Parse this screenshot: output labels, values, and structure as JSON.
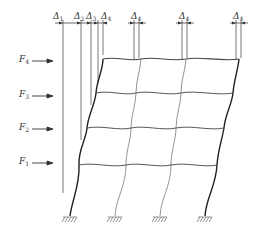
{
  "diagram": {
    "forces": [
      {
        "symbol": "F",
        "sub": "4",
        "y": 61
      },
      {
        "symbol": "F",
        "sub": "3",
        "y": 96
      },
      {
        "symbol": "F",
        "sub": "2",
        "y": 129
      },
      {
        "symbol": "F",
        "sub": "1",
        "y": 163
      }
    ],
    "displacements_left": [
      {
        "symbol": "Δ",
        "sub": "1",
        "x": 62,
        "line_bottom": 193
      },
      {
        "symbol": "Δ",
        "sub": "2",
        "x": 80,
        "line_bottom": 140
      },
      {
        "symbol": "Δ",
        "sub": "3",
        "x": 90,
        "line_bottom": 105
      },
      {
        "symbol": "Δ",
        "sub": "4",
        "x": 100,
        "line_bottom": 55
      }
    ],
    "displacements_right": [
      {
        "symbol": "Δ",
        "sub": "4",
        "x": 137
      },
      {
        "symbol": "Δ",
        "sub": "4",
        "x": 185
      },
      {
        "symbol": "Δ",
        "sub": "4",
        "x": 239
      }
    ],
    "colors": {
      "line": "#333333",
      "light_line": "#888888",
      "background": "#ffffff"
    }
  }
}
